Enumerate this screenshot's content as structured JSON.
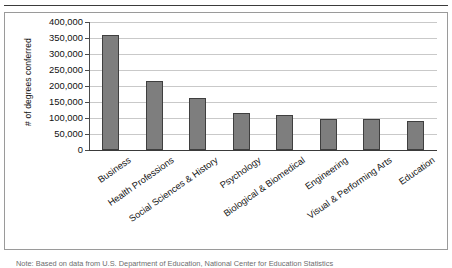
{
  "figure": {
    "footnote": "Note: Based on data from U.S. Department of Education, National Center for Education Statistics"
  },
  "chart_data": {
    "type": "bar",
    "title": "",
    "xlabel": "",
    "ylabel": "# of degrees conferred",
    "ylim": [
      0,
      400000
    ],
    "ytick_step": 50000,
    "grid": true,
    "legend": "none",
    "bar_color": "#7e7e7e",
    "bar_border_color": "#3f3f3f",
    "ytick_labels": [
      "400,000",
      "350,000",
      "300,000",
      "250,000",
      "200,000",
      "150,000",
      "100,000",
      "50,000",
      "0"
    ],
    "ytick_values": [
      400000,
      350000,
      300000,
      250000,
      200000,
      150000,
      100000,
      50000,
      0
    ],
    "categories": [
      "Business",
      "Health Professions",
      "Social Sciences & History",
      "Psychology",
      "Biological & Biomedical",
      "Engineering",
      "Visual & Performing Arts",
      "Education"
    ],
    "values": [
      360000,
      216000,
      164000,
      117000,
      110000,
      98000,
      96000,
      91000
    ]
  }
}
